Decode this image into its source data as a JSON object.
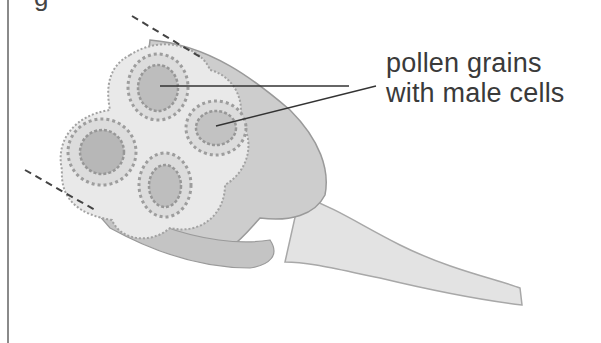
{
  "figure": {
    "cutoff_caption_fragment": "g",
    "label": {
      "line1": "pollen grains",
      "line2": "with male cells"
    },
    "colors": {
      "background": "#ffffff",
      "tissue_light": "#e6e6e6",
      "tissue_mid": "#c9c9c9",
      "tissue_dark": "#a9a9a9",
      "outline": "#8f8f8f",
      "leader_line": "#333333",
      "text": "#3a3a3a",
      "dashed_line": "#444444"
    }
  }
}
